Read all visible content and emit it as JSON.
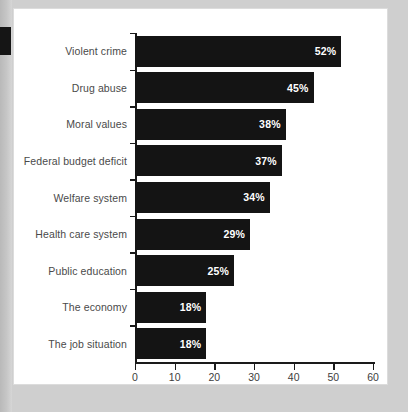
{
  "chart_data": {
    "type": "bar",
    "orientation": "horizontal",
    "title": "",
    "xlabel": "",
    "ylabel": "",
    "categories": [
      "Violent crime",
      "Drug abuse",
      "Moral values",
      "Federal budget deficit",
      "Welfare system",
      "Health care system",
      "Public education",
      "The economy",
      "The job situation"
    ],
    "values": [
      52,
      45,
      38,
      37,
      34,
      29,
      25,
      18,
      18
    ],
    "value_labels": [
      "52%",
      "45%",
      "38%",
      "37%",
      "34%",
      "29%",
      "25%",
      "18%",
      "18%"
    ],
    "xlim": [
      0,
      60
    ],
    "xticks": [
      0,
      10,
      20,
      30,
      40,
      50,
      60
    ],
    "xtick_labels": [
      "0",
      "10",
      "20",
      "30",
      "40",
      "50",
      "60"
    ],
    "grid": false,
    "legend": false,
    "bar_color": "#141414",
    "value_label_color": "#ffffff",
    "category_label_color": "#4a4a4a",
    "axis_color": "#1a1a1a"
  }
}
